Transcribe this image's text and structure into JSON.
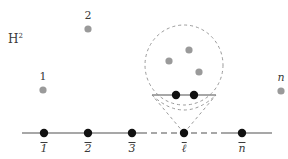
{
  "figure": {
    "width": 288,
    "height": 159,
    "background": "#ffffff",
    "space_label": {
      "text": "H",
      "superscript": "2",
      "x": 8,
      "y": 33
    },
    "colors": {
      "black_point": "#111111",
      "gray_point": "#9a9a9a",
      "solid_line": "#8a8a8a",
      "dashed_line": "#9a9a9a",
      "text": "#3a3a3a"
    },
    "upper_points": [
      {
        "name": "point-1",
        "label": "1",
        "label_style": "upright",
        "cx": 43,
        "cy": 90,
        "r": 3.6,
        "color": "#9a9a9a",
        "label_x": 43,
        "label_y": 76
      },
      {
        "name": "point-2",
        "label": "2",
        "label_style": "upright",
        "cx": 88,
        "cy": 29,
        "r": 3.6,
        "color": "#9a9a9a",
        "label_x": 88,
        "label_y": 15
      },
      {
        "name": "point-n",
        "label": "n",
        "label_style": "italic",
        "cx": 281,
        "cy": 91,
        "r": 3.6,
        "color": "#9a9a9a",
        "label_x": 281,
        "label_y": 77
      }
    ],
    "horoball": {
      "name": "horoball-circle",
      "cx": 184,
      "cy": 65,
      "rx": 39,
      "ry": 40,
      "stroke": "#9a9a9a",
      "dash": "3,3",
      "interior_points": [
        {
          "name": "horoball-point-a",
          "cx": 189,
          "cy": 50,
          "r": 3.6,
          "color": "#9a9a9a"
        },
        {
          "name": "horoball-point-b",
          "cx": 169,
          "cy": 61,
          "r": 3.6,
          "color": "#9a9a9a"
        },
        {
          "name": "horoball-point-c",
          "cx": 199,
          "cy": 72,
          "r": 3.6,
          "color": "#9a9a9a"
        }
      ],
      "chord": {
        "name": "horoball-chord",
        "x1": 152,
        "y1": 95,
        "x2": 216,
        "y2": 95,
        "stroke": "#8a8a8a"
      },
      "chord_points": [
        {
          "name": "chord-point-left",
          "cx": 176,
          "cy": 95,
          "r": 4.2,
          "color": "#111111"
        },
        {
          "name": "chord-point-right",
          "cx": 194,
          "cy": 95,
          "r": 4.2,
          "color": "#111111"
        }
      ],
      "cone_lines": [
        {
          "name": "cone-line-left",
          "x1": 184,
          "y1": 133,
          "x2": 152,
          "y2": 95
        },
        {
          "name": "cone-line-right",
          "x1": 184,
          "y1": 133,
          "x2": 216,
          "y2": 95
        }
      ]
    },
    "baseline": {
      "name": "boundary-line",
      "y": 133,
      "x_start": 22,
      "x_end": 272,
      "solid_segments": [
        {
          "x1": 22,
          "x2": 141
        },
        {
          "x1": 227,
          "x2": 272
        }
      ],
      "dashed_segments": [
        {
          "x1": 141,
          "x2": 227
        }
      ],
      "points": [
        {
          "name": "baseline-point-1",
          "label": "1",
          "cx": 44,
          "cy": 133,
          "r": 4.2,
          "color": "#111111",
          "label_x": 44,
          "label_y": 142,
          "label_style": "italic-bar"
        },
        {
          "name": "baseline-point-2",
          "label": "2",
          "cx": 88,
          "cy": 133,
          "r": 4.2,
          "color": "#111111",
          "label_x": 88,
          "label_y": 142,
          "label_style": "italic-bar"
        },
        {
          "name": "baseline-point-3",
          "label": "3",
          "cx": 132,
          "cy": 133,
          "r": 4.2,
          "color": "#111111",
          "label_x": 132,
          "label_y": 142,
          "label_style": "italic-bar"
        },
        {
          "name": "baseline-point-ell",
          "label": "ℓ",
          "cx": 184,
          "cy": 133,
          "r": 4.2,
          "color": "#111111",
          "label_x": 184,
          "label_y": 142,
          "label_style": "italic-bar"
        },
        {
          "name": "baseline-point-n",
          "label": "n",
          "cx": 242,
          "cy": 133,
          "r": 4.2,
          "color": "#111111",
          "label_x": 242,
          "label_y": 142,
          "label_style": "italic-bar"
        }
      ]
    }
  }
}
